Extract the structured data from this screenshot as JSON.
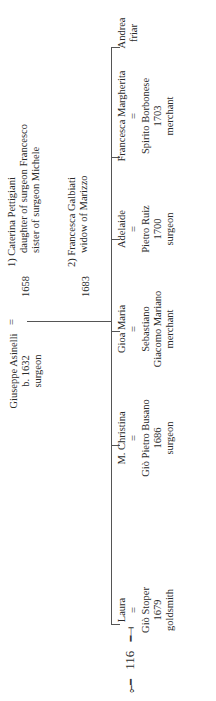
{
  "root": {
    "name": "Giuseppe Asinelli",
    "birth": "b. 1632",
    "occupation": "surgeon",
    "marriage_symbol": "="
  },
  "spouses": [
    {
      "year": "1658",
      "lines": [
        "1) Caterina Pettigiani",
        "daughter of surgeon Francesco",
        "sister of surgeon Michele"
      ]
    },
    {
      "year": "1683",
      "lines": [
        "2) Francesca Galbiati",
        "widow of Marizzo"
      ]
    }
  ],
  "children": [
    {
      "name": "Laura",
      "eq": "=",
      "spouse": "Giò Stoper",
      "year": "1679",
      "occupation": "goldsmith"
    },
    {
      "name": "M. Christina",
      "eq": "=",
      "spouse": "Giò Pietro Busano",
      "year": "1686",
      "occupation": "surgeon"
    },
    {
      "name": "Gioa Maria",
      "eq": "=",
      "spouse": "Sebastiano",
      "spouse2": "Giacomo Mariano",
      "occupation": "merchant"
    },
    {
      "name": "Adelaide",
      "eq": "=",
      "spouse": "Pietro Ruiz",
      "year": "1700",
      "occupation": "surgeon"
    },
    {
      "name": "Francesca Margherita",
      "eq": "=",
      "spouse": "Spirito Borbonese",
      "year": "1703",
      "occupation": "merchant"
    },
    {
      "name": "Andrea",
      "occupation": "friar"
    }
  ],
  "folio": {
    "page_number": "116",
    "left_ornament": "⟜━",
    "right_ornament": "━⟞"
  }
}
